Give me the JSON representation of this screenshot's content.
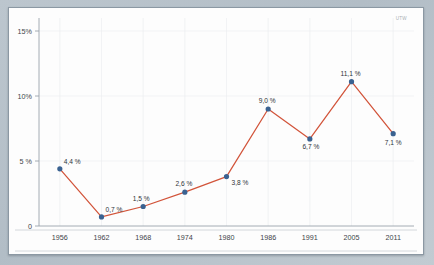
{
  "watermark": "UTW",
  "colors": {
    "line": "#d2543a",
    "marker": "#3a6291",
    "grid": "#eceef0",
    "axis": "#9aa3ab",
    "text": "#3d4349",
    "card_bg": "#fdfdfd",
    "page_bg": "#b9c4cc"
  },
  "chart_data": {
    "type": "line",
    "title": "",
    "subtitle": "",
    "xlabel": "",
    "ylabel": "",
    "categories": [
      "1956",
      "1962",
      "1968",
      "1974",
      "1980",
      "1986",
      "1991",
      "2005",
      "2011"
    ],
    "values": [
      4.4,
      0.7,
      1.5,
      2.6,
      3.8,
      9.0,
      6.7,
      11.1,
      7.1
    ],
    "point_labels": [
      "4,4 %",
      "0,7 %",
      "1,5 %",
      "2,6 %",
      "3,8 %",
      "9,0 %",
      "6,7 %",
      "11,1 %",
      "7,1 %"
    ],
    "ylim": [
      0,
      16
    ],
    "y_ticks": [
      0,
      5,
      10,
      15
    ],
    "y_tick_labels": [
      "0",
      "5 %",
      "10%",
      "15%"
    ],
    "grid": true,
    "legend": "none",
    "series": [
      {
        "name": "",
        "values": [
          4.4,
          0.7,
          1.5,
          2.6,
          3.8,
          9.0,
          6.7,
          11.1,
          7.1
        ]
      }
    ]
  }
}
